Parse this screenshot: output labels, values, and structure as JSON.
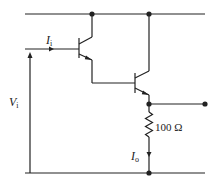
{
  "diagram": {
    "type": "circuit",
    "labels": {
      "input_current": {
        "main": "I",
        "sub": "i"
      },
      "input_voltage": {
        "main": "V",
        "sub": "i"
      },
      "output_current": {
        "main": "I",
        "sub": "o"
      },
      "resistor": "100 Ω"
    },
    "components": [
      {
        "id": "Q1",
        "kind": "npn-transistor"
      },
      {
        "id": "Q2",
        "kind": "npn-transistor"
      },
      {
        "id": "R1",
        "kind": "resistor",
        "value": "100 Ω"
      }
    ],
    "nodes": [
      "top-rail",
      "bottom-rail",
      "output-terminal"
    ],
    "colors": {
      "line": "#222222",
      "background": "#ffffff"
    }
  }
}
